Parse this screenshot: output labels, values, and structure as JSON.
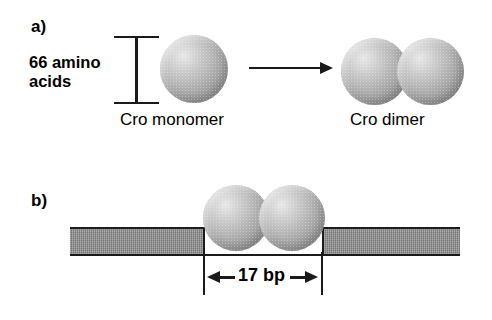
{
  "figure": {
    "panels": [
      {
        "id": "a",
        "letter": "a)",
        "size_label_line1": "66 amino",
        "size_label_line2": "acids",
        "left_caption": "Cro monomer",
        "right_caption": "Cro dimer",
        "reaction_arrow": "rightward-arrow",
        "monomer_count": 1,
        "dimer_subunit_count": 2
      },
      {
        "id": "b",
        "letter": "b)",
        "footprint_label": "17 bp",
        "dimer_subunit_count": 2,
        "dna_segment_count": 2
      }
    ]
  },
  "colors": {
    "ink": "#1a1a1a",
    "dna_gray": "#8e8e8e",
    "sphere_light": "#e8e8e8",
    "sphere_dark": "#8b8b8b",
    "background": "#ffffff"
  }
}
